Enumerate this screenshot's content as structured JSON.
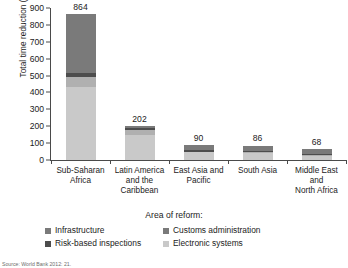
{
  "chart_data": {
    "type": "bar",
    "stacked": true,
    "title": "",
    "xlabel": "",
    "ylabel": "Total time reduction (hours)",
    "ylim": [
      0,
      900
    ],
    "yticks": [
      0,
      100,
      200,
      300,
      400,
      500,
      600,
      700,
      800,
      900
    ],
    "grid": false,
    "legend_title": "Area of reform:",
    "legend_position": "bottom",
    "categories": [
      "Sub-Saharan Africa",
      "Latin America and the Caribbean",
      "East Asia and Pacific",
      "South Asia",
      "Middle East and North Africa"
    ],
    "category_lines": [
      [
        "Sub-Saharan",
        "Africa"
      ],
      [
        "Latin America",
        "and the",
        "Caribbean"
      ],
      [
        "East Asia and",
        "Pacific"
      ],
      [
        "South Asia"
      ],
      [
        "Middle East",
        "and",
        "North Africa"
      ]
    ],
    "totals": [
      864,
      202,
      90,
      86,
      68
    ],
    "series": [
      {
        "name": "Electronic systems",
        "color": "#c9c9c9",
        "values": [
          430,
          150,
          45,
          40,
          24
        ]
      },
      {
        "name": "Risk-based inspections",
        "color": "#b0b0b0",
        "values": [
          60,
          30,
          5,
          6,
          4
        ]
      },
      {
        "name": "Customs administration",
        "color": "#4d4d4d",
        "values": [
          24,
          12,
          8,
          10,
          8
        ]
      },
      {
        "name": "Infrastructure",
        "color": "#7a7a7a",
        "values": [
          350,
          10,
          32,
          30,
          32
        ]
      }
    ],
    "legend_entries": [
      {
        "label": "Infrastructure",
        "color": "#7a7a7a"
      },
      {
        "label": "Customs administration",
        "color": "#7a7a7a"
      },
      {
        "label": "Risk-based inspections",
        "color": "#4d4d4d"
      },
      {
        "label": "Electronic systems",
        "color": "#c9c9c9"
      }
    ],
    "source": "Source: World Bank 2012: 21."
  },
  "axis": {
    "y_title": "Total time reduction (hours)",
    "ticks": [
      "900",
      "800",
      "700",
      "600",
      "500",
      "400",
      "300",
      "200",
      "100",
      "0"
    ]
  },
  "legend": {
    "title": "Area of reform:"
  },
  "bar_values": [
    "864",
    "202",
    "90",
    "86",
    "68"
  ],
  "source_note": "Source: World Bank 2012: 21."
}
